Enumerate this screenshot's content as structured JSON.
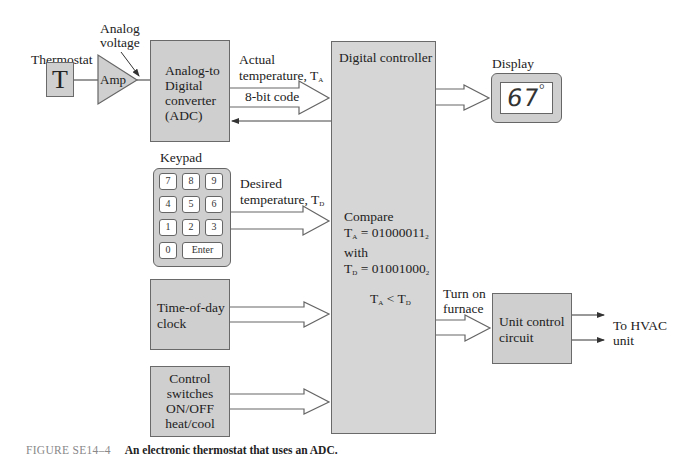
{
  "figure": {
    "number": "FIGURE SE14–4",
    "caption": "An electronic thermostat that uses an ADC."
  },
  "thermostat": {
    "label": "Thermostat",
    "symbol": "T"
  },
  "amplifier": {
    "label": "Amp",
    "annotation_line1": "Analog",
    "annotation_line2": "voltage"
  },
  "adc": {
    "line1": "Analog-to",
    "line2": "Digital",
    "line3": "converter",
    "line4": "(ADC)"
  },
  "adc_output": {
    "line1": "Actual",
    "line2": "temperature, T",
    "sub": "A",
    "bus_label": "8-bit code"
  },
  "controller": {
    "title": "Digital controller",
    "compare_label": "Compare",
    "ta_eq": "T",
    "ta_sub": "A",
    "ta_value": " = 01000011",
    "ta_base": "2",
    "with_label": "with",
    "td_eq": "T",
    "td_sub": "D",
    "td_value": " = 01001000",
    "td_base": "2",
    "result_t1": "T",
    "result_s1": "A",
    "result_op": " < T",
    "result_s2": "D"
  },
  "display": {
    "label": "Display",
    "value": "67",
    "unit": "°"
  },
  "keypad": {
    "label": "Keypad",
    "keys": [
      "7",
      "8",
      "9",
      "4",
      "5",
      "6",
      "1",
      "2",
      "3",
      "0"
    ],
    "enter_label": "Enter"
  },
  "keypad_output": {
    "line1": "Desired",
    "line2": "temperature, T",
    "sub": "D"
  },
  "clock": {
    "line1": "Time-of-day",
    "line2": "clock"
  },
  "switches": {
    "line1": "Control",
    "line2": "switches",
    "line3": "ON/OFF",
    "line4": "heat/cool"
  },
  "furnace_signal": {
    "line1": "Turn on",
    "line2": "furnace"
  },
  "unit_control": {
    "line1": "Unit control",
    "line2": "circuit"
  },
  "hvac_output": {
    "line1": "To HVAC",
    "line2": "unit"
  },
  "colors": {
    "block_fill": "#cfcfcf",
    "block_border": "#6a6a6a",
    "line": "#444444",
    "background": "#ffffff"
  }
}
